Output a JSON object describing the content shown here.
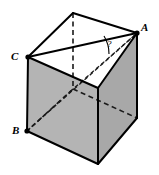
{
  "figure": {
    "kind": "cube-diagram",
    "background_color": "#ffffff",
    "stroke_color": "#000000",
    "left_face_color": "#b4b4b4",
    "right_face_color": "#a8a8a8",
    "top_face_color": "#ffffff",
    "labels": {
      "vertex_a": "A",
      "vertex_b": "B",
      "vertex_c": "C",
      "unknown_angle": "?"
    },
    "vertices": {
      "top_back": [
        73,
        13
      ],
      "top_right_a": [
        137,
        33
      ],
      "top_left_c": [
        28,
        57
      ],
      "top_front": [
        98,
        88
      ],
      "bottom_back": [
        73,
        89
      ],
      "bottom_right": [
        137,
        118
      ],
      "bottom_left_b": [
        27,
        131
      ],
      "bottom_front": [
        98,
        164
      ]
    },
    "label_positions": {
      "vertex_a": [
        141,
        31
      ],
      "vertex_b": [
        14,
        133
      ],
      "vertex_c": [
        13,
        58
      ],
      "unknown_angle": [
        110,
        46
      ]
    }
  }
}
